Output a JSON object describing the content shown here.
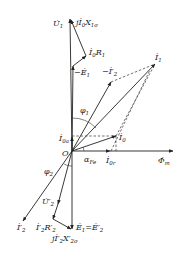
{
  "diagram": {
    "origin_label": "O",
    "labels": {
      "U1": "U̇",
      "U1_sub": "1",
      "jI0X1s": "jİ",
      "jI0X1s_sub0": "0",
      "jI0X1s_x": "X",
      "jI0X1s_sub": "1σ",
      "I0R1": "İ",
      "I0R1_sub0": "0",
      "I0R1_r": "R",
      "I0R1_sub": "1",
      "negE1": "−Ė",
      "negE1_sub": "1",
      "negI2p": "−İ′",
      "negI2p_sub": "2",
      "I1": "İ",
      "I1_sub": "1",
      "phi1": "φ",
      "phi1_sub": "1",
      "I0a": "İ",
      "I0a_sub": "0a",
      "I0": "İ",
      "I0_sub": "0",
      "alphaFe": "α",
      "alphaFe_sub": "Fe",
      "I0r": "İ",
      "I0r_sub": "0r",
      "Phim": "Φ̇",
      "Phim_sub": "m",
      "phi2": "φ",
      "phi2_sub": "2",
      "U2p": "U̇′",
      "U2p_sub": "2",
      "I2p": "İ′",
      "I2p_sub": "2",
      "I2pR2p": "İ′",
      "I2pR2p_sub": "2",
      "I2pR2p_r": "R′",
      "I2pR2p_rsub": "2",
      "E1eqE2p": "Ė",
      "E1eqE2p_sub": "1",
      "E1eqE2p_eq": "=Ė′",
      "E1eqE2p_sub2": "2",
      "jI2pX2s": "jİ′",
      "jI2pX2s_sub": "2",
      "jI2pX2s_x": "X′",
      "jI2pX2s_xsub": "2σ"
    },
    "colors": {
      "stroke": "#222222",
      "background": "#ffffff"
    }
  }
}
